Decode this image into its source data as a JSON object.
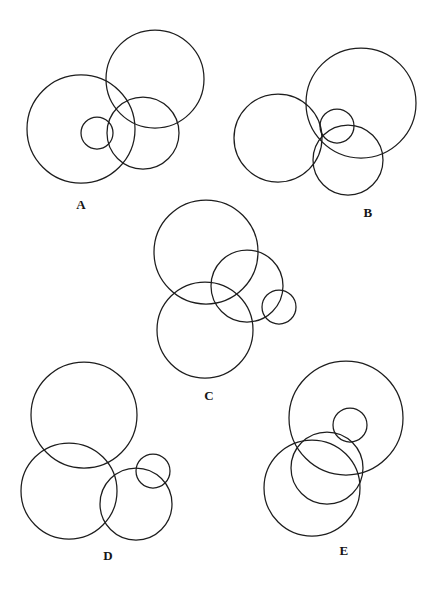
{
  "page": {
    "background_color": "#ffffff",
    "stroke_color": "#1d1d1d",
    "width": 437,
    "height": 590
  },
  "chart_data": {
    "type": "diagram",
    "xlabel": "",
    "ylabel": "",
    "grid": false,
    "legend": null,
    "xlim": [
      0,
      437
    ],
    "ylim": [
      0,
      590
    ],
    "units": "pixels",
    "panels": [
      {
        "label": "A",
        "label_x": 81,
        "label_y": 205,
        "circles": [
          {
            "name": "large-left",
            "cx": 81,
            "cy": 129,
            "r": 54
          },
          {
            "name": "large-top-right",
            "cx": 155,
            "cy": 79,
            "r": 49
          },
          {
            "name": "medium",
            "cx": 143,
            "cy": 133,
            "r": 36
          },
          {
            "name": "small",
            "cx": 97,
            "cy": 133,
            "r": 16
          }
        ]
      },
      {
        "label": "B",
        "label_x": 368,
        "label_y": 213,
        "circles": [
          {
            "name": "large-right",
            "cx": 361,
            "cy": 103,
            "r": 55
          },
          {
            "name": "large-left",
            "cx": 278,
            "cy": 138,
            "r": 44
          },
          {
            "name": "medium",
            "cx": 348,
            "cy": 160,
            "r": 35
          },
          {
            "name": "small",
            "cx": 337,
            "cy": 126,
            "r": 17
          }
        ]
      },
      {
        "label": "C",
        "label_x": 209,
        "label_y": 396,
        "circles": [
          {
            "name": "large-top",
            "cx": 206,
            "cy": 252,
            "r": 52
          },
          {
            "name": "large-bottom",
            "cx": 205,
            "cy": 330,
            "r": 48
          },
          {
            "name": "medium",
            "cx": 247,
            "cy": 286,
            "r": 36
          },
          {
            "name": "small",
            "cx": 279,
            "cy": 307,
            "r": 17
          }
        ]
      },
      {
        "label": "D",
        "label_x": 108,
        "label_y": 556,
        "circles": [
          {
            "name": "large-top",
            "cx": 84,
            "cy": 415,
            "r": 53
          },
          {
            "name": "large-bottom",
            "cx": 69,
            "cy": 491,
            "r": 48
          },
          {
            "name": "medium",
            "cx": 136,
            "cy": 504,
            "r": 36
          },
          {
            "name": "small",
            "cx": 153,
            "cy": 471,
            "r": 17
          }
        ]
      },
      {
        "label": "E",
        "label_x": 344,
        "label_y": 551,
        "circles": [
          {
            "name": "large-top",
            "cx": 346,
            "cy": 418,
            "r": 57
          },
          {
            "name": "large-bottom",
            "cx": 312,
            "cy": 488,
            "r": 48
          },
          {
            "name": "medium",
            "cx": 327,
            "cy": 468,
            "r": 36
          },
          {
            "name": "small",
            "cx": 350,
            "cy": 425,
            "r": 17
          }
        ]
      }
    ]
  },
  "labels": {
    "a": "A",
    "b": "B",
    "c": "C",
    "d": "D",
    "e": "E"
  }
}
